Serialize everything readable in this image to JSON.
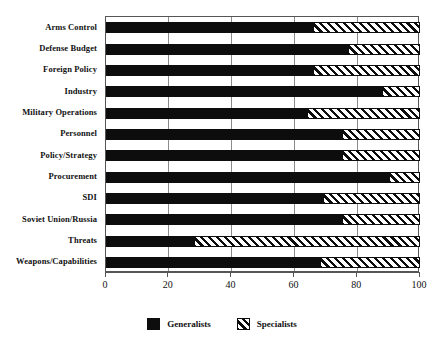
{
  "chart_data": {
    "type": "bar",
    "orientation": "horizontal",
    "stacked": true,
    "percent": true,
    "title": "",
    "subtitle": "",
    "xlabel": "",
    "ylabel": "",
    "xlim": [
      0,
      100
    ],
    "xticks": [
      0,
      20,
      40,
      60,
      80,
      100
    ],
    "xtick_labels": [
      "0",
      "20",
      "40",
      "60",
      "80",
      "100"
    ],
    "grid": true,
    "grid_axis": "x",
    "legend_position": "bottom-center",
    "categories": [
      "Arms Control",
      "Defense Budget",
      "Foreign Policy",
      "Industry",
      "Military Operations",
      "Personnel",
      "Policy/Strategy",
      "Procurement",
      "SDI",
      "Soviet Union/Russia",
      "Threats",
      "Weapons/Capabilities"
    ],
    "series": [
      {
        "name": "Generalists",
        "fill": "solid-black",
        "color": "#0d0d0d",
        "values": [
          66,
          77,
          66,
          88,
          64,
          75,
          75,
          90,
          69,
          75,
          28,
          68
        ]
      },
      {
        "name": "Specialists",
        "fill": "diagonal-hatch",
        "color": "#0d0d0d",
        "values": [
          34,
          23,
          34,
          12,
          36,
          25,
          25,
          10,
          31,
          25,
          72,
          32
        ]
      }
    ]
  },
  "legend": {
    "entries": [
      {
        "label": "Generalists",
        "swatch": "solid-black-swatch"
      },
      {
        "label": "Specialists",
        "swatch": "diagonal-hatch-swatch"
      }
    ]
  },
  "colors": {
    "generalists": "#0d0d0d",
    "specialists_line": "#0d0d0d",
    "axis": "#555555",
    "grid": "#8a8a8a",
    "background": "#ffffff"
  }
}
